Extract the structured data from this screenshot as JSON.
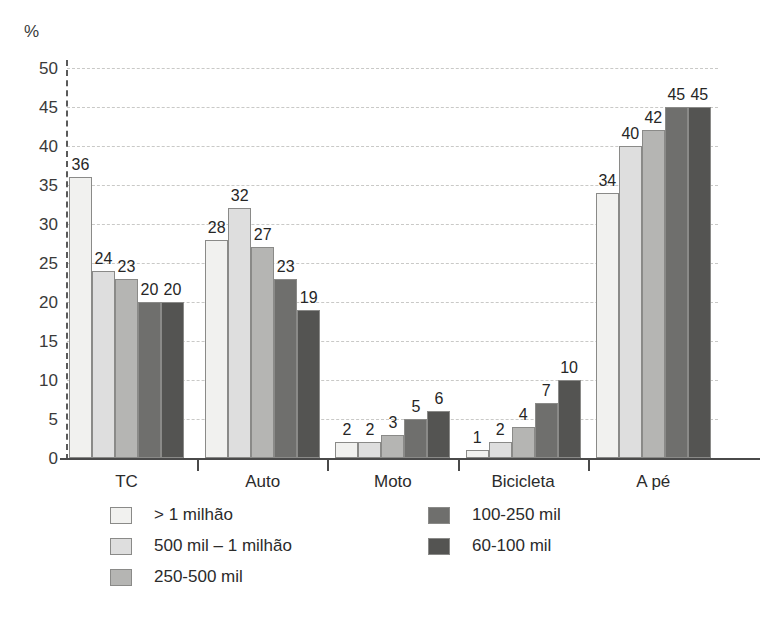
{
  "chart_data": {
    "type": "bar",
    "title": "",
    "subtitle": "",
    "xlabel": "",
    "ylabel": "%",
    "ylim": [
      0,
      50
    ],
    "ytick_step": 5,
    "yticks": [
      0,
      5,
      10,
      15,
      20,
      25,
      30,
      35,
      40,
      45,
      50
    ],
    "grid": true,
    "grid_style": "dashed-horizontal",
    "legend_position": "bottom",
    "value_labels": true,
    "categories": [
      "TC",
      "Auto",
      "Moto",
      "Bicicleta",
      "A pé"
    ],
    "series": [
      {
        "name": "> 1 milhão",
        "color": "#f1f1ef",
        "values": [
          36,
          28,
          2,
          1,
          34
        ]
      },
      {
        "name": "500 mil – 1 milhão",
        "color": "#dedede",
        "values": [
          24,
          32,
          2,
          2,
          40
        ]
      },
      {
        "name": "250-500 mil",
        "color": "#b5b5b3",
        "values": [
          23,
          27,
          3,
          4,
          42
        ]
      },
      {
        "name": "100-250 mil",
        "color": "#6f6f6d",
        "values": [
          20,
          23,
          5,
          7,
          45
        ]
      },
      {
        "name": "60-100 mil",
        "color": "#545452",
        "values": [
          20,
          19,
          6,
          10,
          45
        ]
      }
    ]
  },
  "axis": {
    "unit_label": "%",
    "tick_labels": [
      "0",
      "5",
      "10",
      "15",
      "20",
      "25",
      "30",
      "35",
      "40",
      "45",
      "50"
    ]
  },
  "legend": {
    "column_left": [
      "> 1 milhão",
      "500 mil – 1 milhão",
      "250-500 mil"
    ],
    "column_right": [
      "100-250 mil",
      "60-100 mil"
    ]
  },
  "colors": {
    "series_1": "#f1f1ef",
    "series_2": "#dedede",
    "series_3": "#b5b5b3",
    "series_4": "#6f6f6d",
    "series_5": "#545452",
    "axis": "#4a4a4a",
    "grid": "#c9c9c7",
    "text": "#2b2b2b"
  }
}
